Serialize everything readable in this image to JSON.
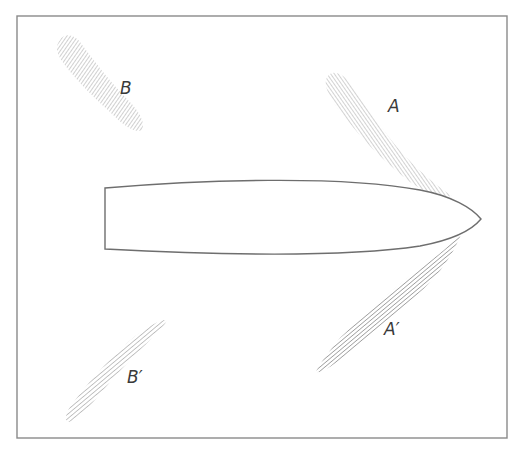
{
  "figure": {
    "frame": {
      "left": 17,
      "top": 16,
      "right": 507,
      "bottom": 438,
      "stroke": "#8a8a8a"
    },
    "projectile": {
      "base_x": 105,
      "top_y": 188,
      "bottom_y": 249,
      "tip_x": 481,
      "tip_y": 219,
      "stroke": "#6e6e6e"
    },
    "hatch_color": "#9a9a9a",
    "regions": [
      {
        "id": "A",
        "label": "A"
      },
      {
        "id": "B",
        "label": "B"
      },
      {
        "id": "A-prime",
        "label": "A′"
      },
      {
        "id": "B-prime",
        "label": "B′"
      }
    ]
  }
}
